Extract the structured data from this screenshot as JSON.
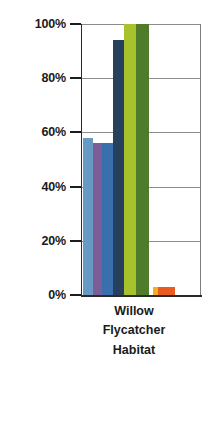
{
  "chart_data": {
    "type": "bar",
    "title": "",
    "subtitle": "",
    "xlabel": "Willow Flycatcher Habitat",
    "xlabel_lines": [
      "Willow",
      "Flycatcher",
      "Habitat"
    ],
    "ylabel": "",
    "ylim": [
      0,
      100
    ],
    "yunit": "%",
    "grid": true,
    "legend": "none",
    "categories": [
      "Willow Flycatcher Habitat"
    ],
    "ytick_labels": [
      "100%",
      "80%",
      "60%",
      "40%",
      "20%",
      "0%"
    ],
    "ytick_values": [
      100,
      80,
      60,
      40,
      20,
      0
    ],
    "series": [
      {
        "name": "series-1",
        "color": "#6699c4",
        "values": [
          58
        ]
      },
      {
        "name": "series-2",
        "color": "#7b5e96",
        "values": [
          56
        ]
      },
      {
        "name": "series-3",
        "color": "#3a6fad",
        "values": [
          56
        ]
      },
      {
        "name": "series-4",
        "color": "#27405e",
        "values": [
          94
        ]
      },
      {
        "name": "series-5",
        "color": "#a8c22e",
        "values": [
          100
        ]
      },
      {
        "name": "series-6",
        "color": "#4f7c2a",
        "values": [
          100
        ]
      },
      {
        "name": "series-7",
        "color": "#f2b01e",
        "values": [
          3
        ]
      },
      {
        "name": "series-8",
        "color": "#ea5b22",
        "values": [
          3
        ]
      }
    ],
    "bars": [
      {
        "name": "bar-light-blue",
        "color": "#6699c4",
        "value": 58,
        "x": 2,
        "width": 10
      },
      {
        "name": "bar-purple",
        "color": "#7b5e96",
        "value": 56,
        "x": 12,
        "width": 9
      },
      {
        "name": "bar-medium-blue",
        "color": "#3a6fad",
        "value": 56,
        "x": 21,
        "width": 11
      },
      {
        "name": "bar-dark-navy",
        "color": "#27405e",
        "value": 94,
        "x": 32,
        "width": 11
      },
      {
        "name": "bar-yellow-green",
        "color": "#a8c22e",
        "value": 100,
        "x": 43,
        "width": 12
      },
      {
        "name": "bar-olive-green",
        "color": "#4f7c2a",
        "value": 100,
        "x": 55,
        "width": 13
      },
      {
        "name": "bar-yellow",
        "color": "#f2b01e",
        "value": 3,
        "x": 72,
        "width": 5
      },
      {
        "name": "bar-orange",
        "color": "#ea5b22",
        "value": 3,
        "x": 77,
        "width": 17
      }
    ],
    "axis_color": "#2b2b2b",
    "grid_color": "#8c8c8c",
    "background": "#ffffff"
  }
}
